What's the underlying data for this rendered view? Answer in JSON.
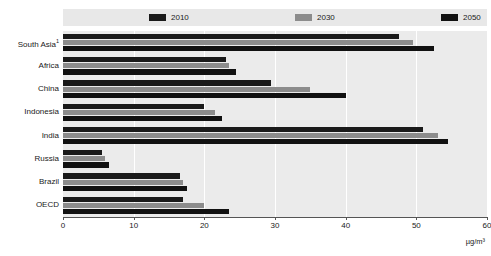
{
  "legend": {
    "items": [
      {
        "label": "2010",
        "color": "#1a1a1a"
      },
      {
        "label": "2030",
        "color": "#8c8c8c"
      },
      {
        "label": "2050",
        "color": "#111111"
      }
    ]
  },
  "axis": {
    "unit": "µg/m³",
    "ticks": [
      "0",
      "10",
      "20",
      "30",
      "40",
      "50",
      "60"
    ]
  },
  "categories": [
    {
      "label": "South Asia",
      "note": "1"
    },
    {
      "label": "Africa",
      "note": ""
    },
    {
      "label": "China",
      "note": ""
    },
    {
      "label": "Indonesia",
      "note": ""
    },
    {
      "label": "India",
      "note": ""
    },
    {
      "label": "Russia",
      "note": ""
    },
    {
      "label": "Brazil",
      "note": ""
    },
    {
      "label": "OECD",
      "note": ""
    }
  ],
  "chart_data": {
    "type": "bar",
    "orientation": "horizontal",
    "title": "",
    "xlabel": "µg/m³",
    "ylabel": "",
    "xlim": [
      0,
      60
    ],
    "grid": true,
    "legend_position": "top",
    "categories": [
      "South Asia",
      "Africa",
      "China",
      "Indonesia",
      "India",
      "Russia",
      "Brazil",
      "OECD"
    ],
    "series": [
      {
        "name": "2010",
        "color": "#1a1a1a",
        "values": [
          47.5,
          23.0,
          29.5,
          20.0,
          51.0,
          5.5,
          16.5,
          17.0
        ]
      },
      {
        "name": "2030",
        "color": "#8c8c8c",
        "values": [
          49.5,
          23.5,
          35.0,
          21.5,
          53.0,
          6.0,
          17.0,
          20.0
        ]
      },
      {
        "name": "2050",
        "color": "#111111",
        "values": [
          52.5,
          24.5,
          40.0,
          22.5,
          54.5,
          6.5,
          17.5,
          23.5
        ]
      }
    ]
  }
}
